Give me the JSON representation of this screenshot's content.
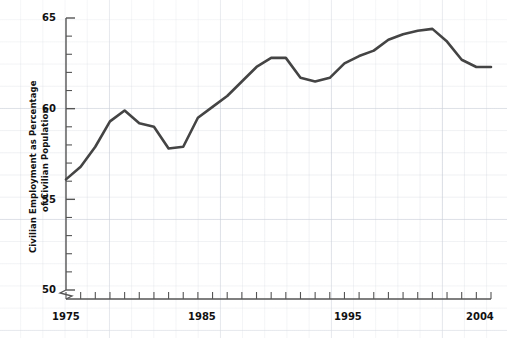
{
  "chart_data": {
    "type": "line",
    "title": "",
    "xlabel": "",
    "ylabel": "Civilian Employment as Percentage of Civilian Population",
    "ylabel_line1": "Civilian Employment as Percentage",
    "ylabel_line2": "of Civilian Population",
    "grid": true,
    "legend": "none",
    "axis_break_y": true,
    "ylim": [
      50,
      65
    ],
    "ytick_labels": [
      "50",
      "55",
      "60",
      "65"
    ],
    "ytick_values": [
      50,
      55,
      60,
      65
    ],
    "yminor_step": 1,
    "xlim": [
      1975,
      2004
    ],
    "xtick_labels": [
      "1975",
      "1985",
      "1995",
      "2004"
    ],
    "xtick_values": [
      1975,
      1985,
      1995,
      2004
    ],
    "xminor_step": 1,
    "line_color": "#444444",
    "x": [
      1975,
      1976,
      1977,
      1978,
      1979,
      1980,
      1981,
      1982,
      1983,
      1984,
      1985,
      1986,
      1987,
      1988,
      1989,
      1990,
      1991,
      1992,
      1993,
      1994,
      1995,
      1996,
      1997,
      1998,
      1999,
      2000,
      2001,
      2002,
      2003,
      2004
    ],
    "values": [
      56.1,
      56.8,
      57.9,
      59.3,
      59.9,
      59.2,
      59.0,
      57.8,
      57.9,
      59.5,
      60.1,
      60.7,
      61.5,
      62.3,
      62.8,
      62.8,
      61.7,
      61.5,
      61.7,
      62.5,
      62.9,
      63.2,
      63.8,
      64.1,
      64.3,
      64.4,
      63.7,
      62.7,
      62.3,
      62.3
    ],
    "points": [
      {
        "year": 1975,
        "value": 56.1
      },
      {
        "year": 1976,
        "value": 56.8
      },
      {
        "year": 1977,
        "value": 57.9
      },
      {
        "year": 1978,
        "value": 59.3
      },
      {
        "year": 1979,
        "value": 59.9
      },
      {
        "year": 1980,
        "value": 59.2
      },
      {
        "year": 1981,
        "value": 59.0
      },
      {
        "year": 1982,
        "value": 57.8
      },
      {
        "year": 1983,
        "value": 57.9
      },
      {
        "year": 1984,
        "value": 59.5
      },
      {
        "year": 1985,
        "value": 60.1
      },
      {
        "year": 1986,
        "value": 60.7
      },
      {
        "year": 1987,
        "value": 61.5
      },
      {
        "year": 1988,
        "value": 62.3
      },
      {
        "year": 1989,
        "value": 62.8
      },
      {
        "year": 1990,
        "value": 62.8
      },
      {
        "year": 1991,
        "value": 61.7
      },
      {
        "year": 1992,
        "value": 61.5
      },
      {
        "year": 1993,
        "value": 61.7
      },
      {
        "year": 1994,
        "value": 62.5
      },
      {
        "year": 1995,
        "value": 62.9
      },
      {
        "year": 1996,
        "value": 63.2
      },
      {
        "year": 1997,
        "value": 63.8
      },
      {
        "year": 1998,
        "value": 64.1
      },
      {
        "year": 1999,
        "value": 64.3
      },
      {
        "year": 2000,
        "value": 64.4
      },
      {
        "year": 2001,
        "value": 63.7
      },
      {
        "year": 2002,
        "value": 62.7
      },
      {
        "year": 2003,
        "value": 62.3
      },
      {
        "year": 2004,
        "value": 62.3
      }
    ]
  }
}
